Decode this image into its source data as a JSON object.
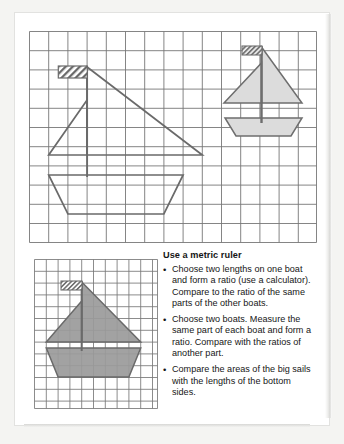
{
  "page": {
    "background_color": "#f4f4f2",
    "card_color": "#ffffff"
  },
  "colors": {
    "grid_line": "#6f6f6f",
    "grid_line_light": "#8d8d8d",
    "boat_outline": "#555555",
    "boat_fill_light": "#d6d6d6",
    "boat_fill_dark": "#9a9a9a",
    "flag_hatch": "#6a6a6a",
    "text": "#161616"
  },
  "main_grid": {
    "name": "main-grid",
    "cols": 15,
    "rows": 11,
    "cell": 19.2
  },
  "small_grid": {
    "name": "small-grid",
    "cols": 9,
    "rows": 9,
    "cell": 13.6
  },
  "instructions": {
    "title": "Use a metric ruler",
    "bullet_char": "•",
    "items": [
      "Choose two lengths on one boat and form a ratio (use a calculator). Compare to the ratio of the same parts of the other boats.",
      "Choose two boats. Measure the same part of each boat and form a ratio. Compare with the ratios of another part.",
      "Compare the areas of the big sails with the lengths of the bottom sides."
    ]
  },
  "figures": [
    {
      "name": "large-boat-outline",
      "grid": "main-grid",
      "style": "outline",
      "description": "Large unfilled sailboat drawn on the main grid with a hatched pennant flag, vertical mast, large right-leaning mainsail triangle, smaller left jib triangle, and a trapezoid hull."
    },
    {
      "name": "small-boat-shaded",
      "grid": "main-grid",
      "style": "light-shaded",
      "description": "Small light-grey shaded sailboat in the upper right of the main grid with hatched pennant flag, mast, mainsail, jib and trapezoid hull."
    },
    {
      "name": "medium-boat-shaded",
      "grid": "small-grid",
      "style": "dark-shaded",
      "description": "Medium dark-grey shaded sailboat on the lower-left grid with hatched pennant flag, mast, mainsail, jib and trapezoid hull."
    }
  ]
}
